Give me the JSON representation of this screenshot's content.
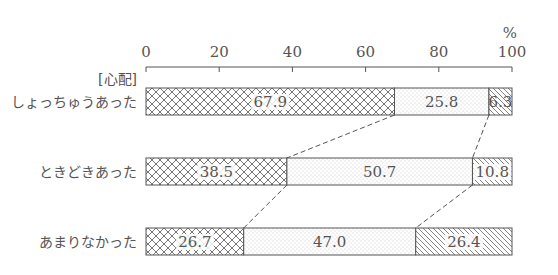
{
  "chart_data": {
    "type": "bar",
    "orientation": "horizontal-stacked-100",
    "title": "",
    "group_label": "[心配]",
    "unit_label": "%",
    "xlim": [
      0,
      100
    ],
    "xticks": [
      0,
      20,
      40,
      60,
      80,
      100
    ],
    "categories": [
      "しょっちゅうあった",
      "ときどきあった",
      "あまりなかった"
    ],
    "series": [
      {
        "name": "segment-1",
        "pattern": "crosshatch",
        "values": [
          67.9,
          38.5,
          26.7
        ]
      },
      {
        "name": "segment-2",
        "pattern": "dots",
        "values": [
          25.8,
          50.7,
          47.0
        ]
      },
      {
        "name": "segment-3",
        "pattern": "diagonal",
        "values": [
          6.3,
          10.8,
          26.4
        ]
      }
    ],
    "value_labels": [
      [
        "67.9",
        "25.8",
        "6.3"
      ],
      [
        "38.5",
        "50.7",
        "10.8"
      ],
      [
        "26.7",
        "47.0",
        "26.4"
      ]
    ],
    "connectors": "dashed lines linking segment boundaries between adjacent bars",
    "legend": "none",
    "grid": false
  },
  "colors": {
    "ink": "#555555",
    "background": "#ffffff"
  }
}
